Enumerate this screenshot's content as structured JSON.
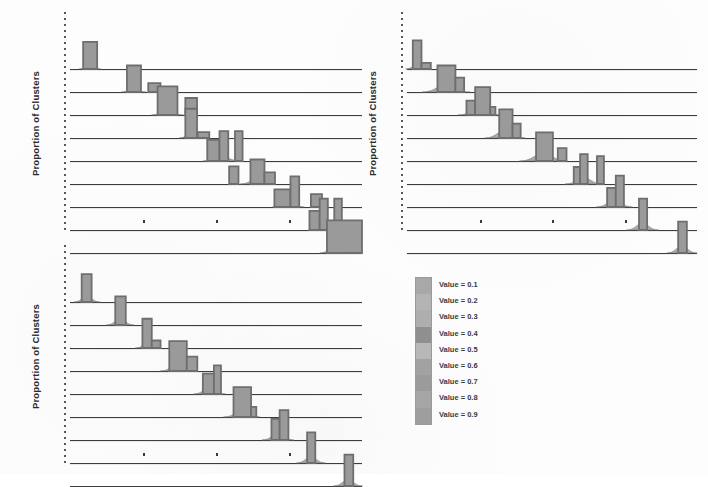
{
  "figure": {
    "background_color": "#fdfdfd",
    "ink_color": "#3c3c3c",
    "bar_fill_color": "#9a9a9a",
    "bar_edge_color": "#6e6e6e"
  },
  "legend": {
    "name": "value-legend",
    "items": [
      {
        "label": "Value = 0.1",
        "color": "#a8a8a8"
      },
      {
        "label": "Value = 0.2",
        "color": "#b4b4b4"
      },
      {
        "label": "Value = 0.3",
        "color": "#aeaeae"
      },
      {
        "label": "Value = 0.4",
        "color": "#8f8f8f"
      },
      {
        "label": "Value = 0.5",
        "color": "#b8b8b8"
      },
      {
        "label": "Value = 0.6",
        "color": "#a2a2a2"
      },
      {
        "label": "Value = 0.7",
        "color": "#9b9b9b"
      },
      {
        "label": "Value = 0.8",
        "color": "#a6a6a6"
      },
      {
        "label": "Value = 0.9",
        "color": "#9e9e9e"
      }
    ]
  },
  "panels": [
    {
      "id": "panel-top-left",
      "ylabel": "Proportion of Clusters",
      "xlabel": "",
      "xticks": [
        0.25,
        0.5,
        0.75
      ]
    },
    {
      "id": "panel-top-right",
      "ylabel": "Proportion of Clusters",
      "xlabel": "",
      "xticks": [
        0.25,
        0.5,
        0.75
      ]
    },
    {
      "id": "panel-bottom-left",
      "ylabel": "Proportion of Clusters",
      "xlabel": "",
      "xticks": [
        0.25,
        0.5,
        0.75
      ]
    }
  ],
  "chart_data": {
    "type": "area",
    "title": "",
    "xlabel": "",
    "ylabel": "Proportion of Clusters",
    "grid": false,
    "legend_position": "center-right",
    "xlim": [
      0,
      1
    ],
    "ylim": [
      0,
      1
    ],
    "series_levels": [
      "0.1",
      "0.2",
      "0.3",
      "0.4",
      "0.5",
      "0.6",
      "0.7",
      "0.8",
      "0.9"
    ],
    "panels": [
      {
        "id": "panel-top-left",
        "ylabel": "Proportion of Clusters",
        "rows": [
          {
            "level": "0.1",
            "bars": [
              {
                "x": 0.045,
                "w": 0.048,
                "h": 0.8
              }
            ],
            "skirt": {
              "center": 0.068,
              "width": 0.075,
              "height": 0.1
            }
          },
          {
            "level": "0.2",
            "bars": [
              {
                "x": 0.195,
                "w": 0.048,
                "h": 0.78
              },
              {
                "x": 0.268,
                "w": 0.042,
                "h": 0.26
              }
            ],
            "skirt": {
              "center": 0.218,
              "width": 0.085,
              "height": 0.12
            }
          },
          {
            "level": "0.3",
            "bars": [
              {
                "x": 0.3,
                "w": 0.068,
                "h": 0.84
              },
              {
                "x": 0.395,
                "w": 0.04,
                "h": 0.5
              }
            ],
            "skirt": {
              "center": 0.334,
              "width": 0.11,
              "height": 0.14
            }
          },
          {
            "level": "0.4",
            "bars": [
              {
                "x": 0.395,
                "w": 0.04,
                "h": 0.86
              },
              {
                "x": 0.437,
                "w": 0.04,
                "h": 0.17
              }
            ],
            "skirt": {
              "center": 0.415,
              "width": 0.085,
              "height": 0.13
            }
          },
          {
            "level": "0.5",
            "bars": [
              {
                "x": 0.47,
                "w": 0.042,
                "h": 0.62
              },
              {
                "x": 0.512,
                "w": 0.03,
                "h": 0.88
              },
              {
                "x": 0.565,
                "w": 0.026,
                "h": 0.88
              }
            ],
            "skirt": {
              "center": 0.52,
              "width": 0.13,
              "height": 0.13
            }
          },
          {
            "level": "0.6",
            "bars": [
              {
                "x": 0.545,
                "w": 0.032,
                "h": 0.52
              },
              {
                "x": 0.618,
                "w": 0.048,
                "h": 0.72
              },
              {
                "x": 0.666,
                "w": 0.036,
                "h": 0.34
              }
            ],
            "skirt": {
              "center": 0.64,
              "width": 0.115,
              "height": 0.14
            }
          },
          {
            "level": "0.7",
            "bars": [
              {
                "x": 0.7,
                "w": 0.055,
                "h": 0.52
              },
              {
                "x": 0.755,
                "w": 0.03,
                "h": 0.9
              },
              {
                "x": 0.825,
                "w": 0.038,
                "h": 0.38
              }
            ],
            "skirt": {
              "center": 0.748,
              "width": 0.11,
              "height": 0.13
            }
          },
          {
            "level": "0.8",
            "bars": [
              {
                "x": 0.82,
                "w": 0.035,
                "h": 0.56
              },
              {
                "x": 0.855,
                "w": 0.028,
                "h": 0.92
              },
              {
                "x": 0.905,
                "w": 0.026,
                "h": 0.92
              }
            ],
            "skirt": {
              "center": 0.868,
              "width": 0.105,
              "height": 0.13
            }
          },
          {
            "level": "0.9",
            "bars": [
              {
                "x": 0.88,
                "w": 0.12,
                "h": 0.96
              }
            ],
            "skirt": {
              "center": 0.9,
              "width": 0.09,
              "height": 0.14
            }
          }
        ]
      },
      {
        "id": "panel-top-right",
        "ylabel": "Proportion of Clusters",
        "rows": [
          {
            "level": "0.1",
            "bars": [
              {
                "x": 0.02,
                "w": 0.03,
                "h": 0.84
              },
              {
                "x": 0.05,
                "w": 0.032,
                "h": 0.18
              }
            ],
            "skirt": {
              "center": 0.04,
              "width": 0.09,
              "height": 0.16
            }
          },
          {
            "level": "0.2",
            "bars": [
              {
                "x": 0.105,
                "w": 0.062,
                "h": 0.78
              },
              {
                "x": 0.167,
                "w": 0.03,
                "h": 0.42
              }
            ],
            "skirt": {
              "center": 0.135,
              "width": 0.165,
              "height": 0.22
            }
          },
          {
            "level": "0.3",
            "bars": [
              {
                "x": 0.205,
                "w": 0.03,
                "h": 0.42
              },
              {
                "x": 0.235,
                "w": 0.052,
                "h": 0.82
              },
              {
                "x": 0.287,
                "w": 0.018,
                "h": 0.24
              }
            ],
            "skirt": {
              "center": 0.25,
              "width": 0.15,
              "height": 0.2
            }
          },
          {
            "level": "0.4",
            "bars": [
              {
                "x": 0.318,
                "w": 0.046,
                "h": 0.84
              },
              {
                "x": 0.364,
                "w": 0.028,
                "h": 0.42
              }
            ],
            "skirt": {
              "center": 0.338,
              "width": 0.14,
              "height": 0.22
            }
          },
          {
            "level": "0.5",
            "bars": [
              {
                "x": 0.445,
                "w": 0.058,
                "h": 0.84
              },
              {
                "x": 0.52,
                "w": 0.03,
                "h": 0.38
              }
            ],
            "skirt": {
              "center": 0.47,
              "width": 0.165,
              "height": 0.22
            }
          },
          {
            "level": "0.6",
            "bars": [
              {
                "x": 0.575,
                "w": 0.022,
                "h": 0.5
              },
              {
                "x": 0.597,
                "w": 0.026,
                "h": 0.88
              },
              {
                "x": 0.655,
                "w": 0.024,
                "h": 0.82
              }
            ],
            "skirt": {
              "center": 0.61,
              "width": 0.13,
              "height": 0.18
            }
          },
          {
            "level": "0.7",
            "bars": [
              {
                "x": 0.69,
                "w": 0.03,
                "h": 0.56
              },
              {
                "x": 0.72,
                "w": 0.028,
                "h": 0.92
              }
            ],
            "skirt": {
              "center": 0.715,
              "width": 0.125,
              "height": 0.2
            }
          },
          {
            "level": "0.8",
            "bars": [
              {
                "x": 0.8,
                "w": 0.028,
                "h": 0.92
              }
            ],
            "skirt": {
              "center": 0.812,
              "width": 0.11,
              "height": 0.2
            }
          },
          {
            "level": "0.9",
            "bars": [
              {
                "x": 0.935,
                "w": 0.03,
                "h": 0.92
              }
            ],
            "skirt": {
              "center": 0.948,
              "width": 0.105,
              "height": 0.2
            }
          }
        ]
      },
      {
        "id": "panel-bottom-left",
        "ylabel": "Proportion of Clusters",
        "rows": [
          {
            "level": "0.1",
            "bars": [
              {
                "x": 0.04,
                "w": 0.034,
                "h": 0.82
              }
            ],
            "skirt": {
              "center": 0.058,
              "width": 0.09,
              "height": 0.16
            }
          },
          {
            "level": "0.2",
            "bars": [
              {
                "x": 0.155,
                "w": 0.036,
                "h": 0.84
              }
            ],
            "skirt": {
              "center": 0.172,
              "width": 0.095,
              "height": 0.18
            }
          },
          {
            "level": "0.3",
            "bars": [
              {
                "x": 0.248,
                "w": 0.032,
                "h": 0.86
              },
              {
                "x": 0.28,
                "w": 0.03,
                "h": 0.22
              }
            ],
            "skirt": {
              "center": 0.268,
              "width": 0.09,
              "height": 0.14
            }
          },
          {
            "level": "0.4",
            "bars": [
              {
                "x": 0.34,
                "w": 0.06,
                "h": 0.88
              },
              {
                "x": 0.4,
                "w": 0.036,
                "h": 0.42
              }
            ],
            "skirt": {
              "center": 0.368,
              "width": 0.12,
              "height": 0.18
            }
          },
          {
            "level": "0.5",
            "bars": [
              {
                "x": 0.455,
                "w": 0.038,
                "h": 0.6
              },
              {
                "x": 0.493,
                "w": 0.024,
                "h": 0.84
              }
            ],
            "skirt": {
              "center": 0.478,
              "width": 0.11,
              "height": 0.18
            }
          },
          {
            "level": "0.6",
            "bars": [
              {
                "x": 0.56,
                "w": 0.06,
                "h": 0.88
              },
              {
                "x": 0.62,
                "w": 0.018,
                "h": 0.3
              }
            ],
            "skirt": {
              "center": 0.588,
              "width": 0.125,
              "height": 0.18
            }
          },
          {
            "level": "0.7",
            "bars": [
              {
                "x": 0.69,
                "w": 0.028,
                "h": 0.62
              },
              {
                "x": 0.718,
                "w": 0.03,
                "h": 0.88
              }
            ],
            "skirt": {
              "center": 0.712,
              "width": 0.11,
              "height": 0.18
            }
          },
          {
            "level": "0.8",
            "bars": [
              {
                "x": 0.812,
                "w": 0.028,
                "h": 0.9
              }
            ],
            "skirt": {
              "center": 0.825,
              "width": 0.1,
              "height": 0.18
            }
          },
          {
            "level": "0.9",
            "bars": [
              {
                "x": 0.94,
                "w": 0.03,
                "h": 0.92
              }
            ],
            "skirt": {
              "center": 0.952,
              "width": 0.1,
              "height": 0.18
            }
          }
        ]
      }
    ]
  }
}
